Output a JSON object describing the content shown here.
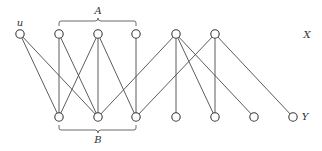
{
  "diagram": {
    "type": "bipartite-graph",
    "labels": {
      "vertex_u": "u",
      "set_A": "A",
      "set_B": "B",
      "part_X": "X",
      "part_Y": "Y"
    },
    "colors": {
      "edge": "#4a4a4a",
      "node_stroke": "#3a3a3a",
      "node_fill": "#ffffff",
      "background": "#ffffff"
    },
    "top_row": {
      "part": "X",
      "y": 34,
      "nodes": [
        {
          "id": "u",
          "x": 20,
          "label": "u"
        },
        {
          "id": "a1",
          "x": 59,
          "group": "A"
        },
        {
          "id": "a2",
          "x": 98,
          "group": "A"
        },
        {
          "id": "a3",
          "x": 136,
          "group": "A"
        },
        {
          "id": "x5",
          "x": 176
        },
        {
          "id": "x6",
          "x": 215
        }
      ]
    },
    "bottom_row": {
      "part": "Y",
      "y": 117,
      "nodes": [
        {
          "id": "b1",
          "x": 59,
          "group": "B"
        },
        {
          "id": "b2",
          "x": 98,
          "group": "B"
        },
        {
          "id": "b3",
          "x": 136,
          "group": "B"
        },
        {
          "id": "y4",
          "x": 176
        },
        {
          "id": "y5",
          "x": 215
        },
        {
          "id": "y6",
          "x": 254
        },
        {
          "id": "y7",
          "x": 293
        }
      ]
    },
    "edges": [
      [
        "u",
        "b1"
      ],
      [
        "u",
        "b2"
      ],
      [
        "a1",
        "b1"
      ],
      [
        "a1",
        "b2"
      ],
      [
        "a2",
        "b1"
      ],
      [
        "a2",
        "b2"
      ],
      [
        "a2",
        "b3"
      ],
      [
        "a3",
        "b3"
      ],
      [
        "x5",
        "b2"
      ],
      [
        "x5",
        "y4"
      ],
      [
        "x5",
        "y5"
      ],
      [
        "x5",
        "y6"
      ],
      [
        "x6",
        "b3"
      ],
      [
        "x6",
        "y5"
      ],
      [
        "x6",
        "y7"
      ]
    ],
    "braces": [
      {
        "label": "A",
        "from_x": 59,
        "to_x": 136,
        "position": "above"
      },
      {
        "label": "B",
        "from_x": 59,
        "to_x": 136,
        "position": "below"
      }
    ]
  }
}
